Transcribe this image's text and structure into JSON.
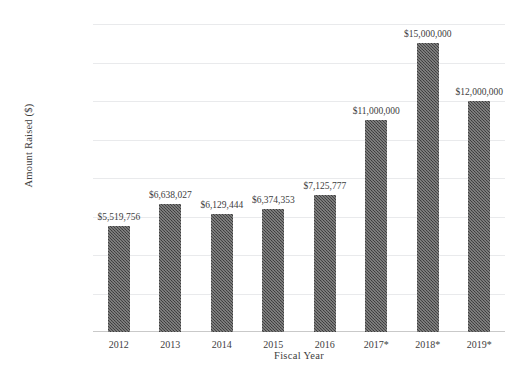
{
  "chart_data": {
    "type": "bar",
    "title": "",
    "xlabel": "Fiscal Year",
    "ylabel": "Amount Raised ($)",
    "categories": [
      "2012",
      "2013",
      "2014",
      "2015",
      "2016",
      "2017*",
      "2018*",
      "2019*"
    ],
    "values": [
      5519756,
      6638027,
      6129444,
      6374353,
      7125777,
      11000000,
      15000000,
      12000000
    ],
    "data_labels": [
      "$5,519,756",
      "$6,638,027",
      "$6,129,444",
      "$6,374,353",
      "$7,125,777",
      "$11,000,000",
      "$15,000,000",
      "$12,000,000"
    ],
    "ytick_labels": [
      "$16,000,000",
      "$14,000,000",
      "$12,000,000",
      "$10,000,000",
      "$800,000",
      "$600,000",
      "$400,000",
      "$200,000",
      "$-"
    ],
    "ytick_values": [
      16000000,
      14000000,
      12000000,
      10000000,
      8000000,
      6000000,
      4000000,
      2000000,
      0
    ],
    "ylim": [
      0,
      16000000
    ],
    "grid": true,
    "legend": false,
    "bar_color": "#4b4b4b",
    "gridline_color": "#e9eaec",
    "text_color": "#3d3d3d"
  }
}
